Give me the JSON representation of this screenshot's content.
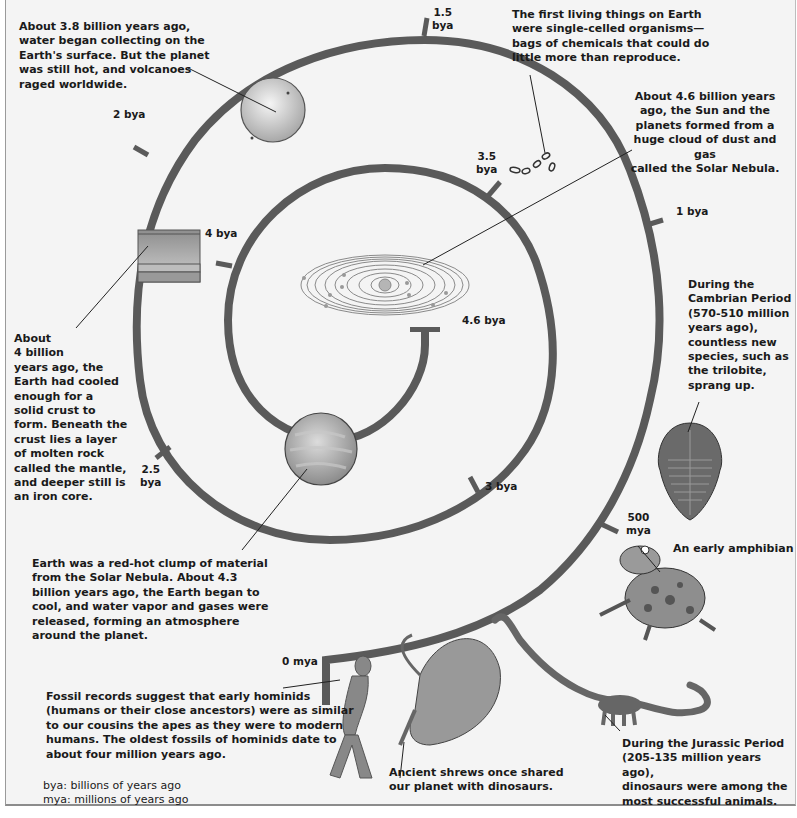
{
  "diagram": {
    "spiral_color": "#5a5a5a",
    "background": "#f4f4f4",
    "time_markers": [
      {
        "id": "4.6bya",
        "label": "4.6 bya"
      },
      {
        "id": "4bya",
        "label": "4 bya"
      },
      {
        "id": "3.5bya",
        "label": "3.5\nbya"
      },
      {
        "id": "3bya",
        "label": "3 bya"
      },
      {
        "id": "2.5bya",
        "label": "2.5\nbya"
      },
      {
        "id": "2bya",
        "label": "2 bya"
      },
      {
        "id": "1.5bya",
        "label": "1.5\nbya"
      },
      {
        "id": "1bya",
        "label": "1 bya"
      },
      {
        "id": "500mya",
        "label": "500\nmya"
      },
      {
        "id": "0mya",
        "label": "0 mya"
      }
    ],
    "captions": {
      "water": "About 3.8 billion years ago,\nwater began collecting on the\nEarth's surface. But the planet\nwas still hot, and volcanoes\nraged worldwide.",
      "first_life": "The first living things on Earth\nwere single-celled organisms—\nbags of chemicals that could do\nlittle more than reproduce.",
      "solar_nebula": "About 4.6 billion years\nago, the Sun and the\nplanets formed from a\nhuge cloud of dust and gas\ncalled the Solar Nebula.",
      "crust": "About\n4 billion\nyears ago, the\nEarth had cooled\nenough for a\nsolid crust to\nform. Beneath the\ncrust lies a layer\nof molten rock\ncalled the mantle,\nand deeper still is\nan iron core.",
      "cambrian": "During the\nCambrian Period\n(570-510 million\nyears ago),\ncountless new\nspecies, such as\nthe trilobite,\nsprang up.",
      "red_hot": "Earth was a red-hot clump of material\nfrom the Solar Nebula. About 4.3\nbillion years ago, the Earth began to\ncool, and water vapor and gases were\nreleased, forming an atmosphere\naround the planet.",
      "amphibian": "An early amphibian",
      "hominids": "Fossil records suggest that early hominids\n(humans or their close ancestors) were as similar\nto our cousins the apes as they were to modern\nhumans. The oldest fossils of hominids date to\nabout four million years ago.",
      "shrews": "Ancient shrews once shared\nour planet with dinosaurs.",
      "jurassic": "During the Jurassic Period\n(205-135 million years ago),\ndinosaurs were among the\nmost successful animals."
    },
    "legend": {
      "bya": "bya: billions of years ago",
      "mya": "mya: millions of years ago"
    },
    "illustrations": [
      "solar-system-orbits",
      "molten-earth-planet",
      "earth-crust-layers",
      "cratered-planet",
      "single-celled-organisms",
      "trilobite",
      "early-amphibian",
      "sauropod-dinosaur",
      "ancient-shrew",
      "early-hominid"
    ]
  }
}
